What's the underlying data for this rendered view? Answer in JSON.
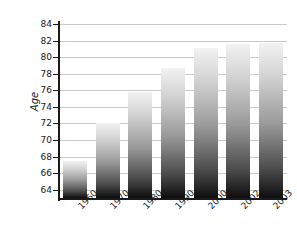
{
  "chart_data": {
    "type": "bar",
    "title": "",
    "subtitle": "",
    "xlabel": "",
    "ylabel": "Age",
    "categories": [
      "1960",
      "1970",
      "1980",
      "1990",
      "2000",
      "2002",
      "2003"
    ],
    "values": [
      67.5,
      72.0,
      75.8,
      78.7,
      81.1,
      81.6,
      81.7
    ],
    "series": [
      {
        "name": "Age",
        "values": [
          67.5,
          72.0,
          75.8,
          78.7,
          81.1,
          81.6,
          81.7
        ]
      }
    ],
    "ylim": [
      63,
      84
    ],
    "y_ticks": [
      64,
      66,
      68,
      70,
      72,
      74,
      76,
      78,
      80,
      82,
      84
    ],
    "y_tick_labels": [
      "64",
      "66",
      "68",
      "70",
      "72",
      "74",
      "76",
      "78",
      "80",
      "82",
      "84"
    ],
    "grid": true,
    "grid_axis": "y",
    "legend": false,
    "legend_position": "none",
    "bar_fill": "vertical-gradient-light-to-dark",
    "colors": {
      "bar_top": "#f2f2f2",
      "bar_bottom": "#0d0d0d",
      "gridline": "#c9c9c9",
      "axis": "#1a1a1a",
      "background": "#ffffff",
      "text": "#1a1a1a"
    }
  },
  "axes": {
    "y_title": "Age"
  }
}
